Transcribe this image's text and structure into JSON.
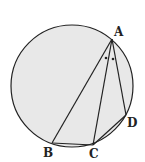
{
  "diagram": {
    "type": "geometry",
    "circle": {
      "cx": 72,
      "cy": 86,
      "r": 61,
      "fill": "#e8e8e8",
      "stroke": "#222222"
    },
    "points": {
      "A": {
        "label": "A",
        "x": 112,
        "y": 39
      },
      "B": {
        "label": "B",
        "x": 52,
        "y": 143
      },
      "C": {
        "label": "C",
        "x": 93,
        "y": 145
      },
      "D": {
        "label": "D",
        "x": 126,
        "y": 115
      }
    },
    "segments": [
      "AB",
      "AC",
      "AD",
      "BC",
      "CD"
    ],
    "angle_marks": "two dots indicating angle BAC equals angle CAD"
  }
}
